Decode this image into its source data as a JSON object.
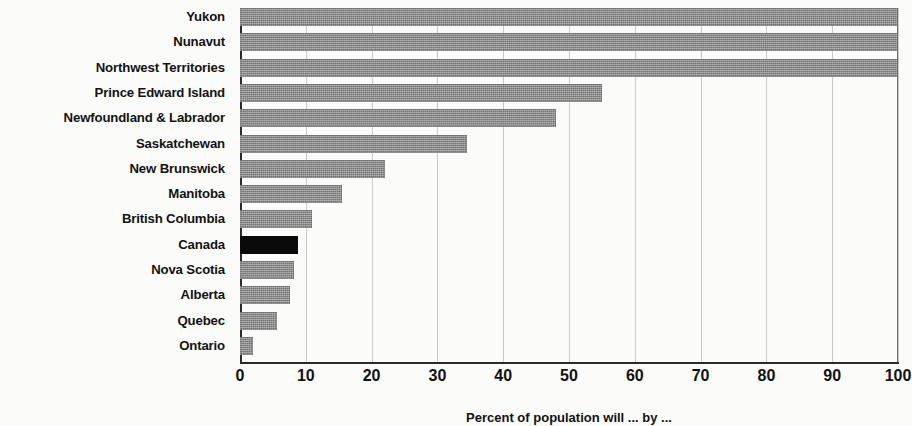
{
  "chart_data": {
    "type": "bar",
    "orientation": "horizontal",
    "title": "",
    "xlabel": "Percent of population will ... by ...",
    "ylabel": "",
    "xlim": [
      0,
      100
    ],
    "xticks": [
      0,
      10,
      20,
      30,
      40,
      50,
      60,
      70,
      80,
      90,
      100
    ],
    "xtick_labels": [
      "0",
      "10",
      "20",
      "30",
      "40",
      "50",
      "60",
      "70",
      "80",
      "90",
      "100"
    ],
    "grid": true,
    "legend": "none",
    "categories": [
      "Yukon",
      "Nunavut",
      "Northwest Territories",
      "Prince Edward Island",
      "Newfoundland & Labrador",
      "Saskatchewan",
      "New Brunswick",
      "Manitoba",
      "British Columbia",
      "Canada",
      "Nova Scotia",
      "Alberta",
      "Quebec",
      "Ontario"
    ],
    "values": [
      100,
      100,
      100,
      55,
      48,
      34.5,
      22,
      15.5,
      11,
      8.8,
      8.2,
      7.6,
      5.6,
      2
    ],
    "highlight_category": "Canada",
    "colors": {
      "bar": "#8c8c8c",
      "bar_highlight": "#0a0a0a",
      "axis": "#2b2b2b",
      "gridline": "#c9c9c9",
      "text": "#121212",
      "background": "#fbfbfa"
    }
  }
}
